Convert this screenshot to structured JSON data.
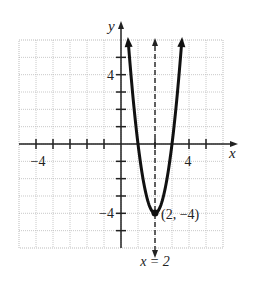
{
  "chart_data": {
    "type": "line",
    "title": "",
    "xlabel": "x",
    "ylabel": "y",
    "xlim": [
      -6,
      6
    ],
    "ylim": [
      -6,
      6
    ],
    "grid": true,
    "x_tick_labels": [
      {
        "value": -4,
        "label": "−4"
      },
      {
        "value": 4,
        "label": "4"
      }
    ],
    "y_tick_labels": [
      {
        "value": 4,
        "label": "4"
      },
      {
        "value": -4,
        "label": "−4"
      }
    ],
    "series": [
      {
        "name": "parabola",
        "equation": "y = 4(x − 2)² − 4",
        "x": [
          0.42,
          0.5,
          1,
          1.5,
          2,
          2.5,
          3,
          3.5,
          3.58
        ],
        "y": [
          6,
          5,
          0,
          -3,
          -4,
          -3,
          0,
          5,
          6
        ],
        "arrows_both_ends": true
      }
    ],
    "axis_of_symmetry": {
      "x": 2,
      "label": "x = 2",
      "style": "dashed"
    },
    "annotations": [
      {
        "x": 2,
        "y": -4,
        "text": "(2, −4)",
        "marker": "filled-circle"
      }
    ]
  },
  "labels": {
    "x_axis": "x",
    "y_axis": "y",
    "x_neg4": "−4",
    "x_pos4": "4",
    "y_pos4": "4",
    "y_neg4": "−4",
    "vertex": "(2, −4)",
    "symmetry": "x = 2"
  }
}
